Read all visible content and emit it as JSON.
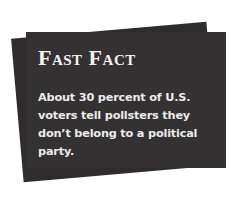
{
  "fast_fact": {
    "title": "Fast Fact",
    "body": "About 30 percent of U.S. voters tell pollsters they don’t belong to a political party.",
    "colors": {
      "card_background": "#333132",
      "back_card": "#2e2c2d",
      "text": "#f4f2f0",
      "page_background": "#ffffff"
    }
  }
}
